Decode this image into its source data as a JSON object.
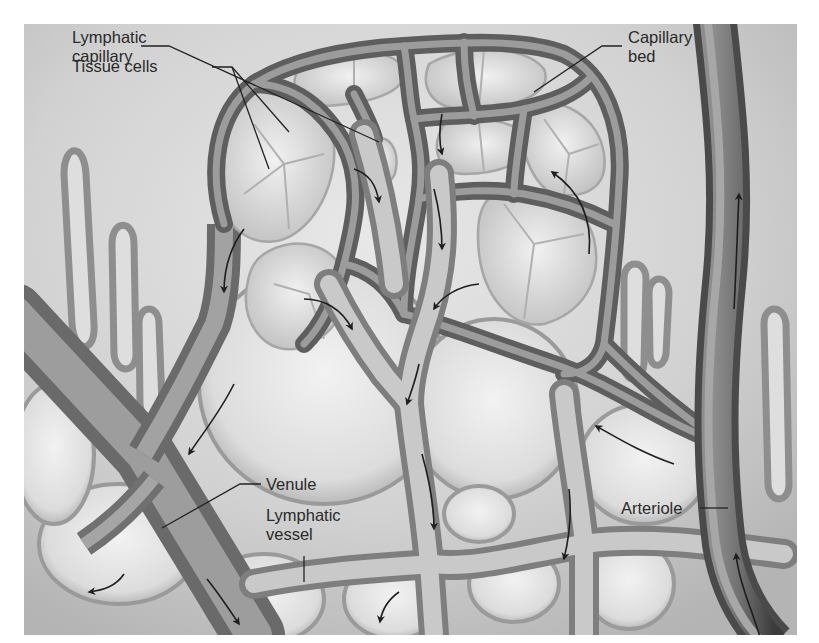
{
  "figure": {
    "labels": {
      "lymphatic_capillary": {
        "line1": "Lymphatic",
        "line2": "capillary"
      },
      "tissue_cells": {
        "text": "Tissue cells"
      },
      "capillary_bed": {
        "line1": "Capillary",
        "line2": "bed"
      },
      "venule": {
        "text": "Venule"
      },
      "lymphatic_vessel": {
        "line1": "Lymphatic",
        "line2": "vessel"
      },
      "arteriole": {
        "text": "Arteriole"
      }
    },
    "colors": {
      "page_background": "#ffffff",
      "tissue_background": "#c9c9c9",
      "tissue_light": "#e6e6e6",
      "cell_fill": "#d8d8d8",
      "cell_border": "#a6a6a6",
      "vessel_dark": "#5e5e5e",
      "vessel_mid": "#8a8a8a",
      "vessel_light": "#b5b5b5",
      "lymph_light": "#cfcfcf",
      "arrow": "#1e1e1e",
      "label_text": "#2a2a2a",
      "leader_line": "#222222"
    },
    "flow_arrows": [
      {
        "id": "capillary-to-lymph-1",
        "direction": "down"
      },
      {
        "id": "capillary-to-lymph-2",
        "direction": "down"
      },
      {
        "id": "capillary-to-lymph-3",
        "direction": "down-left"
      },
      {
        "id": "capillary-to-lymph-4",
        "direction": "down-right"
      },
      {
        "id": "capillary-left-down",
        "direction": "down"
      },
      {
        "id": "capillary-right-up",
        "direction": "up"
      },
      {
        "id": "arteriole-up-top",
        "direction": "up"
      },
      {
        "id": "arteriole-up-bottom",
        "direction": "up"
      },
      {
        "id": "arteriole-branch-left",
        "direction": "up-left"
      },
      {
        "id": "venule-down",
        "direction": "down-right"
      },
      {
        "id": "venule-branch-down",
        "direction": "down-left"
      },
      {
        "id": "lymph-vessel-down-1",
        "direction": "down"
      },
      {
        "id": "lymph-vessel-down-2",
        "direction": "down"
      },
      {
        "id": "lymph-vessel-down-3",
        "direction": "down"
      },
      {
        "id": "lymph-vessel-down-4",
        "direction": "down"
      },
      {
        "id": "bottom-left-curve",
        "direction": "left"
      },
      {
        "id": "bottom-center-curve",
        "direction": "down"
      }
    ]
  }
}
